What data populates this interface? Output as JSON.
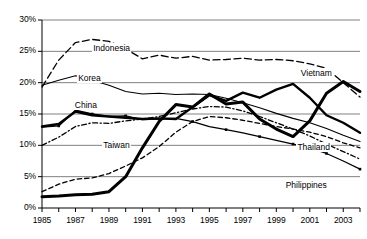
{
  "chart_data": {
    "type": "line",
    "title": "",
    "xlabel": "",
    "ylabel": "",
    "xlim": [
      1985,
      2004
    ],
    "ylim": [
      0,
      30
    ],
    "grid": true,
    "legend_position": "inline-labels",
    "y_tick_labels": [
      "0%",
      "5%",
      "10%",
      "15%",
      "20%",
      "25%",
      "30%"
    ],
    "y_tick_values": [
      0,
      5,
      10,
      15,
      20,
      25,
      30
    ],
    "x_tick_labels": [
      "1985",
      "1987",
      "1989",
      "1991",
      "1993",
      "1995",
      "1997",
      "1999",
      "2001",
      "2003"
    ],
    "x_tick_values": [
      1985,
      1987,
      1989,
      1991,
      1993,
      1995,
      1997,
      1999,
      2001,
      2003
    ],
    "x": [
      1985,
      1986,
      1987,
      1988,
      1989,
      1990,
      1991,
      1992,
      1993,
      1994,
      1995,
      1996,
      1997,
      1998,
      1999,
      2000,
      2001,
      2002,
      2003,
      2004
    ],
    "series": [
      {
        "name": "Indonesia",
        "style": "long-dash",
        "label_x": 1988.0,
        "label_y": 25.6,
        "values": [
          19.3,
          23.6,
          26.4,
          26.9,
          26.6,
          25.4,
          23.8,
          24.4,
          23.9,
          24.2,
          23.6,
          23.7,
          23.9,
          23.6,
          23.7,
          23.5,
          23.0,
          22.3,
          20.0,
          17.7
        ]
      },
      {
        "name": "Korea",
        "style": "thin-solid",
        "label_x": 1987.1,
        "label_y": 20.8,
        "values": [
          19.6,
          20.4,
          21.1,
          20.4,
          19.6,
          18.6,
          18.2,
          18.3,
          18.1,
          18.2,
          18.1,
          17.5,
          16.8,
          16.0,
          15.1,
          14.3,
          13.6,
          12.7,
          11.6,
          10.6
        ]
      },
      {
        "name": "China",
        "style": "dash-dot",
        "label_x": 1986.9,
        "label_y": 16.5,
        "values": [
          10.0,
          11.3,
          13.0,
          13.6,
          13.5,
          13.9,
          14.2,
          14.6,
          15.2,
          15.8,
          16.2,
          16.1,
          15.5,
          14.6,
          13.6,
          12.6,
          11.5,
          10.2,
          9.0,
          7.8
        ]
      },
      {
        "name": "Taiwan",
        "style": "dashed",
        "label_x": 1988.6,
        "label_y": 10.1,
        "values": [
          2.6,
          3.8,
          4.6,
          4.8,
          5.5,
          6.7,
          8.0,
          9.8,
          12.1,
          13.8,
          14.6,
          14.4,
          14.0,
          13.5,
          13.0,
          12.6,
          12.1,
          11.4,
          10.4,
          9.6
        ]
      },
      {
        "name": "Vietnam",
        "style": "thick-solid",
        "label_x": 2000.4,
        "label_y": 21.5,
        "values": [
          13.0,
          13.4,
          15.4,
          14.8,
          14.6,
          14.4,
          14.2,
          14.3,
          14.2,
          16.1,
          18.0,
          17.1,
          18.4,
          17.6,
          18.9,
          19.8,
          17.6,
          14.8,
          13.6,
          12.0
        ]
      },
      {
        "name": "Thailand",
        "style": "thin-solid-marker",
        "label_x": 2000.2,
        "label_y": 9.8,
        "values": [
          12.9,
          13.1,
          15.6,
          15.0,
          14.6,
          14.7,
          14.1,
          14.2,
          14.3,
          13.8,
          13.0,
          12.5,
          12.0,
          11.4,
          10.8,
          10.2,
          9.6,
          8.7,
          7.5,
          6.2
        ]
      },
      {
        "name": "Philippines",
        "style": "extra-thick-solid",
        "label_x": 1999.5,
        "label_y": 3.6,
        "values": [
          1.8,
          1.9,
          2.1,
          2.2,
          2.6,
          5.0,
          9.6,
          13.8,
          16.5,
          16.1,
          18.2,
          16.6,
          16.9,
          14.2,
          12.6,
          11.4,
          13.9,
          18.3,
          20.2,
          18.6
        ]
      }
    ]
  }
}
